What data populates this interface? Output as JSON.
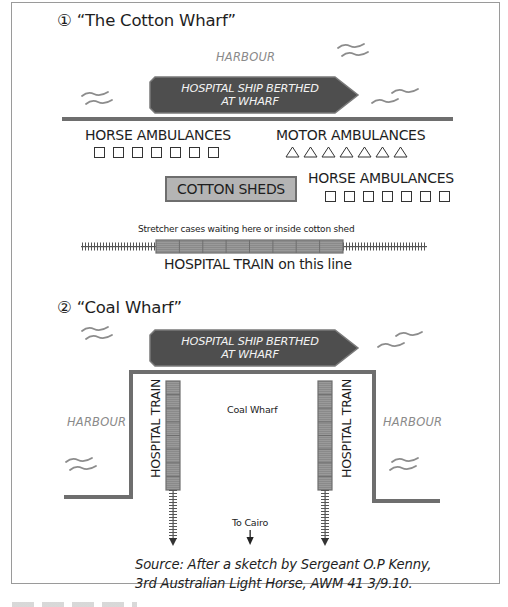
{
  "frame": {
    "border_color": "#9a9a9a"
  },
  "colors": {
    "ship_fill": "#4e4e4e",
    "ship_edge": "#7a7a7a",
    "wharf_line": "#6e6e6e",
    "train_fill": "#8c8c8c",
    "cotton_fill": "#b4b4b4",
    "wave": "#8c8c8c",
    "harbour_text": "#8a8a8a"
  },
  "section1": {
    "number_icon": "①",
    "title": "“The Cotton Wharf”",
    "harbour_label": "HARBOUR",
    "ship": {
      "line1": "HOSPITAL SHIP BERTHED",
      "line2": "AT WHARF"
    },
    "horse_ambulances_left": {
      "label": "HORSE AMBULANCES",
      "count": 7,
      "symbol": "square"
    },
    "motor_ambulances": {
      "label": "MOTOR AMBULANCES",
      "count": 7,
      "symbol": "triangle"
    },
    "cotton_sheds_label": "COTTON SHEDS",
    "horse_ambulances_right": {
      "label": "HORSE AMBULANCES",
      "count": 7,
      "symbol": "square"
    },
    "stretcher_note": "Stretcher cases waiting here or inside cotton shed",
    "train": {
      "carriages": 8,
      "label": "HOSPITAL TRAIN on this line"
    }
  },
  "section2": {
    "number_icon": "②",
    "title": "“Coal Wharf”",
    "ship": {
      "line1": "HOSPITAL SHIP BERTHED",
      "line2": "AT WHARF"
    },
    "harbour_left": "HARBOUR",
    "harbour_right": "HARBOUR",
    "coal_wharf_label": "Coal Wharf",
    "train_left": {
      "label": "HOSPITAL TRAIN",
      "carriages": 8
    },
    "train_right": {
      "label": "HOSPITAL TRAIN",
      "carriages": 8
    },
    "to_cairo_label": "To Cairo"
  },
  "source": {
    "line1": "Source: After a sketch by Sergeant O.P Kenny,",
    "line2": "3rd Australian Light Horse, AWM 41 3/9.10."
  }
}
